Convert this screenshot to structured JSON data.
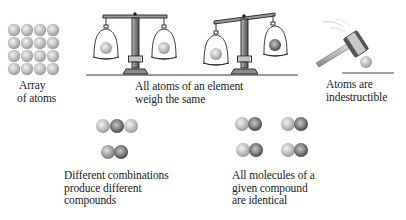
{
  "figure": {
    "panels": [
      {
        "id": "array",
        "caption_lines": [
          "Array",
          "of atoms"
        ],
        "grid": {
          "rows": 4,
          "cols": 4
        }
      },
      {
        "id": "weigh",
        "caption_lines": [
          "All atoms of an element",
          "weigh the same"
        ],
        "icons": [
          "balance-scale-level",
          "balance-scale-tilted"
        ]
      },
      {
        "id": "indestructible",
        "caption_lines": [
          "Atoms are",
          "indestructible"
        ],
        "icons": [
          "hammer",
          "atom"
        ]
      },
      {
        "id": "combinations",
        "caption_lines": [
          "Different combinations",
          "produce different",
          "compounds"
        ],
        "molecules": [
          "triatomic",
          "diatomic"
        ]
      },
      {
        "id": "identical",
        "caption_lines": [
          "All molecules of a",
          "given compound",
          "are identical"
        ],
        "molecules": [
          "diatomic",
          "diatomic",
          "diatomic",
          "diatomic"
        ]
      }
    ],
    "colors": {
      "atom_light": "#d8d8d8",
      "atom_mid": "#a8a8a8",
      "atom_dark": "#6e6e6e",
      "line": "#333333"
    }
  }
}
